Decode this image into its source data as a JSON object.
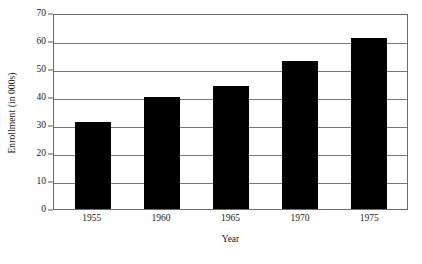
{
  "chart_data": {
    "type": "bar",
    "title": "",
    "categories": [
      "1955",
      "1960",
      "1965",
      "1970",
      "1975"
    ],
    "values": [
      31,
      40,
      44,
      53,
      61
    ],
    "series": [
      {
        "name": "Enrollment",
        "values": [
          31,
          40,
          44,
          53,
          61
        ]
      }
    ],
    "xlabel": "Year",
    "ylabel": "Enrollment (in 000s)",
    "ylim": [
      0,
      70
    ],
    "ytick_values": [
      0,
      10,
      20,
      30,
      40,
      50,
      60,
      70
    ],
    "ytick_labels": [
      "0",
      "10",
      "20",
      "30",
      "40",
      "50",
      "60",
      "70"
    ],
    "grid": true,
    "grid_axis": "y",
    "legend": false,
    "legend_position": "none",
    "bar_color": "#000000",
    "grid_color": "#77777a",
    "frame_color": "#6b6b6d",
    "background_color": "#ffffff"
  }
}
